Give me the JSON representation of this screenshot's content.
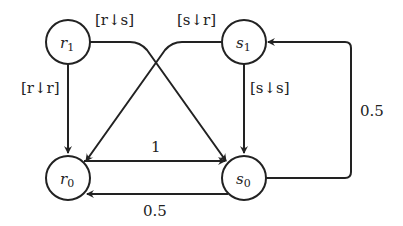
{
  "diagram": {
    "type": "state-transition-graph",
    "nodes": [
      {
        "id": "r1",
        "base": "r",
        "sub": "1",
        "cx": 68,
        "cy": 42
      },
      {
        "id": "s1",
        "base": "s",
        "sub": "1",
        "cx": 244,
        "cy": 42
      },
      {
        "id": "r0",
        "base": "r",
        "sub": "0",
        "cx": 68,
        "cy": 178
      },
      {
        "id": "s0",
        "base": "s",
        "sub": "0",
        "cx": 244,
        "cy": 178
      }
    ],
    "edges": [
      {
        "from": "r1",
        "to": "r0",
        "label": "[r↓r]"
      },
      {
        "from": "r1",
        "to": "s0",
        "label": "[r↓s]"
      },
      {
        "from": "s1",
        "to": "r0",
        "label": "[s↓r]"
      },
      {
        "from": "s1",
        "to": "s0",
        "label": "[s↓s]"
      },
      {
        "from": "r0",
        "to": "s0",
        "label": "1"
      },
      {
        "from": "s0",
        "to": "r0",
        "label": "0.5"
      },
      {
        "from": "s0",
        "to": "s1",
        "label": "0.5"
      }
    ],
    "labels": {
      "r1_r0": "[r↓r]",
      "r1_s0": "[r↓s]",
      "s1_r0": "[s↓r]",
      "s1_s0": "[s↓s]",
      "r0_s0": "1",
      "s0_r0": "0.5",
      "s0_s1": "0.5"
    },
    "node_labels": {
      "r1": {
        "base": "r",
        "sub": "1"
      },
      "s1": {
        "base": "s",
        "sub": "1"
      },
      "r0": {
        "base": "r",
        "sub": "0"
      },
      "s0": {
        "base": "s",
        "sub": "0"
      }
    },
    "colors": {
      "stroke": "#222222",
      "background": "#ffffff"
    }
  }
}
